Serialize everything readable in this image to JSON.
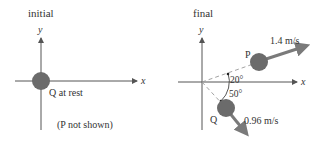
{
  "panels": {
    "initial": {
      "title": "initial",
      "x_axis_label": "x",
      "y_axis_label": "y",
      "ball_q_label": "Q at rest",
      "note": "(P not shown)"
    },
    "final": {
      "title": "final",
      "x_axis_label": "x",
      "y_axis_label": "y",
      "ball_p_label": "P",
      "ball_q_label": "Q",
      "p_speed": "1.4 m/s",
      "q_speed": "0.96 m/s",
      "p_angle": "20°",
      "q_angle": "50°"
    }
  },
  "colors": {
    "ball": "#6b6b6b",
    "velocity_arrow": "#7a7a7a",
    "axis": "#555555",
    "dashed_line": "#999999"
  }
}
